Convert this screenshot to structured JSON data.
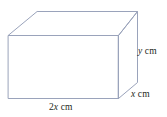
{
  "figure": {
    "shape_name": "cuboid",
    "stroke_color": "#9aa3bb",
    "background_color": "#ffffff",
    "text_color": "#231f20",
    "labels": {
      "width": {
        "coefficient": "2",
        "variable": "x",
        "unit": "cm"
      },
      "height": {
        "coefficient": "",
        "variable": "y",
        "unit": "cm"
      },
      "depth": {
        "coefficient": "",
        "variable": "x",
        "unit": "cm"
      }
    }
  }
}
